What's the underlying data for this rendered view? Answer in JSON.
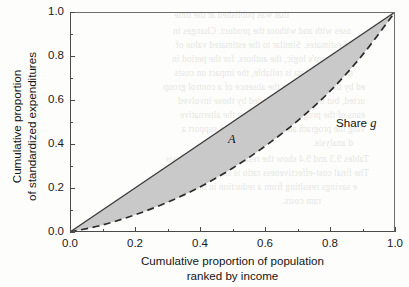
{
  "chart_data": {
    "type": "line",
    "title": "",
    "subtitle": "",
    "xlabel_line1": "Cumulative proportion of population",
    "xlabel_line2": "ranked by income",
    "ylabel_line1": "Cumulative proportion",
    "ylabel_line2": "of standardized expenditures",
    "xlim": [
      0.0,
      1.0
    ],
    "ylim": [
      0.0,
      1.0
    ],
    "grid": false,
    "legend_position": "none",
    "x_ticks": [
      "0.0",
      "0.2",
      "0.4",
      "0.6",
      "0.8",
      "1.0"
    ],
    "x_tick_values": [
      0.0,
      0.2,
      0.4,
      0.6,
      0.8,
      1.0
    ],
    "y_ticks": [
      "0.0",
      "0.2",
      "0.4",
      "0.6",
      "0.8",
      "1.0"
    ],
    "y_tick_values": [
      0.0,
      0.2,
      0.4,
      0.6,
      0.8,
      1.0
    ],
    "minor_ticks_x": [
      0.1,
      0.3,
      0.5,
      0.7,
      0.9
    ],
    "minor_ticks_y": [
      0.1,
      0.3,
      0.5,
      0.7,
      0.9
    ],
    "series": [
      {
        "name": "Line of equality",
        "style": "solid",
        "color": "#3c3c3c",
        "x": [
          0.0,
          1.0
        ],
        "values": [
          0.0,
          1.0
        ]
      },
      {
        "name": "Share g",
        "style": "dashed",
        "color": "#2b2b2b",
        "x": [
          0.0,
          0.1,
          0.2,
          0.3,
          0.4,
          0.5,
          0.6,
          0.7,
          0.8,
          0.9,
          1.0
        ],
        "values": [
          0.0,
          0.032,
          0.078,
          0.135,
          0.205,
          0.29,
          0.39,
          0.505,
          0.64,
          0.805,
          1.0
        ]
      }
    ],
    "shaded_region": {
      "name": "A",
      "label": "A",
      "fill_color": "#c9c9c9",
      "between": [
        "Line of equality",
        "Share g"
      ]
    },
    "annotations": [
      {
        "name": "area-label",
        "text": "A",
        "x": 0.49,
        "y": 0.44,
        "italic": true
      },
      {
        "name": "share-curve-label",
        "text": "Share ",
        "italic_suffix": "g",
        "x": 0.83,
        "y": 0.55
      }
    ]
  },
  "bleed_text": [
    "that was published at the time",
    "nses with and without the product. Changes in",
    "ed estimates. Similar to the estimated value of",
    "e program's logic, the authors, for the period in",
    "nd that the data is reliable, the impact on costs",
    "ed by the program. In the absence of a control group",
    "ucted, but the results provided by those involved",
    "eans of the program. Quantifying the alternative",
    "ving the program and reported data to support a",
    "d analysis.",
    "Tables 9.3 and 9.4 show the results from the analysis",
    "The final cost-effectiveness ratio is shown in the",
    "e savings resulting from a reduction in the cost of",
    "ram costs."
  ]
}
